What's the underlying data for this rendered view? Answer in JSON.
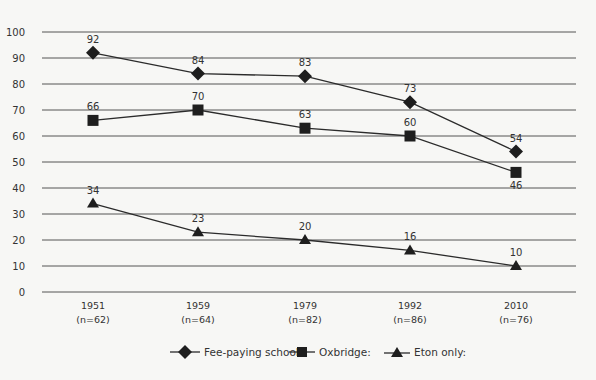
{
  "chart_data": {
    "type": "line",
    "title": "",
    "xlabel": "",
    "ylabel": "",
    "ylim": [
      0,
      100
    ],
    "yticks": [
      0,
      10,
      20,
      30,
      40,
      50,
      60,
      70,
      80,
      90,
      100
    ],
    "grid": true,
    "legend_position": "bottom",
    "categories": [
      "1951",
      "1959",
      "1979",
      "1992",
      "2010"
    ],
    "category_sublabels": [
      "(n=62)",
      "(n=64)",
      "(n=82)",
      "(n=86)",
      "(n=76)"
    ],
    "series": [
      {
        "name": "Fee-paying schools:",
        "marker": "diamond",
        "values": [
          92,
          84,
          83,
          73,
          54
        ]
      },
      {
        "name": "Oxbridge:",
        "marker": "square",
        "values": [
          66,
          70,
          63,
          60,
          46
        ]
      },
      {
        "name": "Eton only:",
        "marker": "triangle",
        "values": [
          34,
          23,
          20,
          16,
          10
        ]
      }
    ],
    "colors": {
      "line": "#2b2b2b",
      "marker": "#1e1e1e",
      "grid": "#555555",
      "background": "#f7f7f5"
    }
  }
}
